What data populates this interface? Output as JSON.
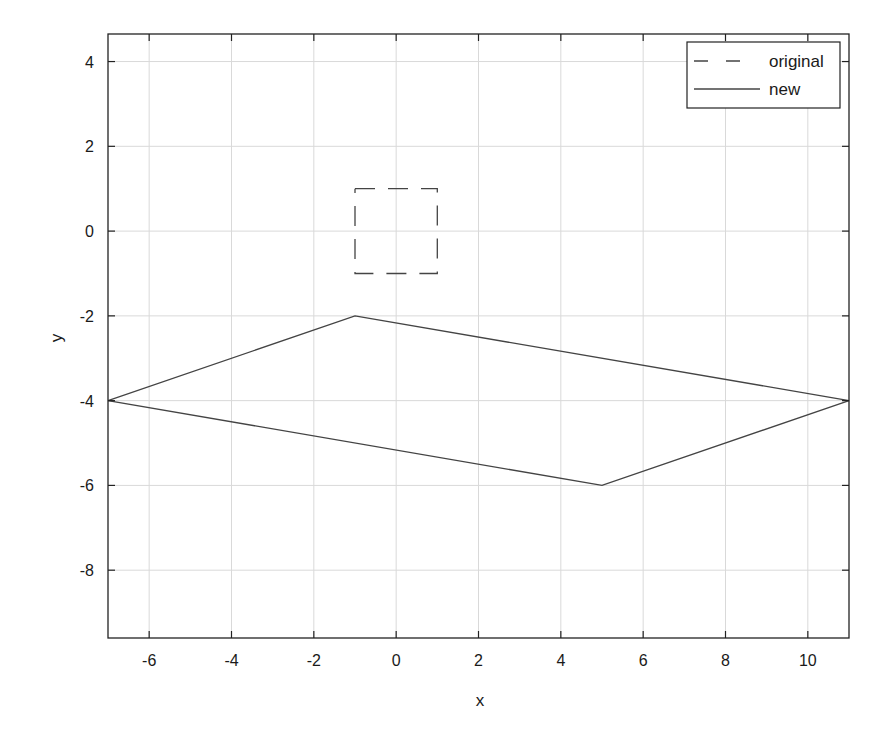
{
  "chart_data": {
    "type": "line",
    "title": "",
    "xlabel": "x",
    "ylabel": "y",
    "xlim": [
      -7,
      11
    ],
    "ylim": [
      -9.6,
      4.65
    ],
    "xticks": [
      -6,
      -4,
      -2,
      0,
      2,
      4,
      6,
      8,
      10
    ],
    "yticks": [
      -8,
      -6,
      -4,
      -2,
      0,
      2,
      4
    ],
    "grid": true,
    "legend_position": "upper right",
    "series": [
      {
        "name": "original",
        "style": "dashed",
        "color": "#444444",
        "x": [
          -1,
          1,
          1,
          -1,
          -1
        ],
        "y": [
          1,
          1,
          -1,
          -1,
          1
        ]
      },
      {
        "name": "new",
        "style": "solid",
        "color": "#444444",
        "x": [
          -7,
          -1,
          11,
          5,
          -7
        ],
        "y": [
          -4,
          -2,
          -4,
          -6,
          -4
        ]
      }
    ]
  },
  "labels": {
    "xlabel": "x",
    "ylabel": "y",
    "legend": [
      "original",
      "new"
    ]
  }
}
